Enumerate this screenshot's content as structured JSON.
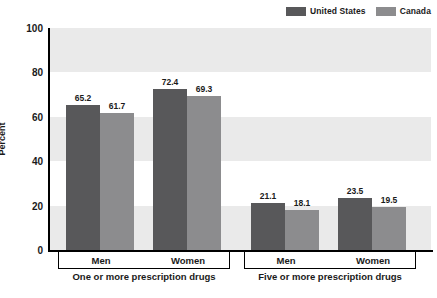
{
  "chart_data": {
    "type": "bar",
    "title": "",
    "xlabel": "",
    "ylabel": "Percent",
    "ylim": [
      0,
      100
    ],
    "ytick_labels": [
      "100",
      "80",
      "60",
      "40",
      "20",
      "0"
    ],
    "yticks": [
      100,
      80,
      60,
      40,
      20,
      0
    ],
    "grid": false,
    "banding": "alternating shaded horizontal bands every 20 percent",
    "legend_position": "top-right",
    "categories": [
      "Men",
      "Women",
      "Men",
      "Women"
    ],
    "group_labels": [
      "One or more prescription drugs",
      "Five or more prescription drugs"
    ],
    "series": [
      {
        "name": "United States",
        "color": "#58585a",
        "values": [
          65.2,
          72.4,
          21.1,
          23.5
        ]
      },
      {
        "name": "Canada",
        "color": "#8c8c8e",
        "values": [
          61.7,
          69.3,
          18.1,
          19.5
        ]
      }
    ],
    "groups": [
      {
        "label": "One or more prescription drugs",
        "categories": [
          {
            "label": "Men",
            "bars": [
              {
                "series": "United States",
                "value": 65.2
              },
              {
                "series": "Canada",
                "value": 61.7
              }
            ]
          },
          {
            "label": "Women",
            "bars": [
              {
                "series": "United States",
                "value": 72.4
              },
              {
                "series": "Canada",
                "value": 69.3
              }
            ]
          }
        ]
      },
      {
        "label": "Five or more prescription drugs",
        "categories": [
          {
            "label": "Men",
            "bars": [
              {
                "series": "United States",
                "value": 21.1
              },
              {
                "series": "Canada",
                "value": 18.1
              }
            ]
          },
          {
            "label": "Women",
            "bars": [
              {
                "series": "United States",
                "value": 23.5
              },
              {
                "series": "Canada",
                "value": 19.5
              }
            ]
          }
        ]
      }
    ],
    "value_labels": [
      "65.2",
      "61.7",
      "72.4",
      "69.3",
      "21.1",
      "18.1",
      "23.5",
      "19.5"
    ]
  },
  "legend": {
    "entries": [
      {
        "label": "United States",
        "color": "#58585a"
      },
      {
        "label": "Canada",
        "color": "#8c8c8e"
      }
    ]
  },
  "axis": {
    "y_label": "Percent",
    "y_ticks": [
      "100",
      "80",
      "60",
      "40",
      "20",
      "0"
    ]
  },
  "colors": {
    "united_states": "#58585a",
    "canada": "#8c8c8e",
    "band_shade": "#eaeaea",
    "band_plain": "#ffffff",
    "axis": "#000000",
    "text": "#1a1a1a"
  }
}
